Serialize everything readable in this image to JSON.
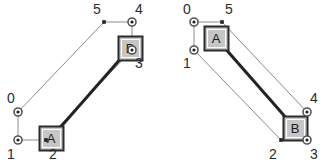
{
  "figure": {
    "background_color": "#ffffff",
    "panels": [
      {
        "id": "left",
        "name": "left-diagram",
        "nodes": [
          {
            "id": "A",
            "label": "A",
            "x": 39,
            "y": 126,
            "w": 24,
            "h": 24,
            "fill": "#c6c6c6",
            "stroke": "#2b2b2b"
          },
          {
            "id": "B",
            "label": "B",
            "x": 118,
            "y": 36,
            "w": 24,
            "h": 24,
            "fill": "#c6c6c6",
            "stroke": "#2b2b2b"
          }
        ],
        "points": [
          {
            "id": "p0",
            "label": "0",
            "x": 18,
            "y": 112,
            "marker": "ring",
            "label_x": 7,
            "label_y": 103
          },
          {
            "id": "p1",
            "label": "1",
            "x": 18,
            "y": 140,
            "marker": "ring",
            "label_x": 7,
            "label_y": 159
          },
          {
            "id": "p2",
            "label": "2",
            "x": 46,
            "y": 140,
            "marker": "dot",
            "label_x": 49,
            "label_y": 159
          },
          {
            "id": "p3",
            "label": "3",
            "x": 132,
            "y": 50,
            "marker": "ring",
            "label_x": 135,
            "label_y": 68
          },
          {
            "id": "p4",
            "label": "4",
            "x": 132,
            "y": 22,
            "marker": "ring",
            "label_x": 135,
            "label_y": 14
          },
          {
            "id": "p5",
            "label": "5",
            "x": 104,
            "y": 22,
            "marker": "dot",
            "label_x": 93,
            "label_y": 14
          }
        ],
        "thin_edges": [
          {
            "from": "p0",
            "to": "p1"
          },
          {
            "from": "p1",
            "to": "p2"
          },
          {
            "from": "p0",
            "to": "p5"
          },
          {
            "from": "p2",
            "to": "p3"
          },
          {
            "from": "p5",
            "to": "p4"
          },
          {
            "from": "p4",
            "to": "p3"
          }
        ],
        "thick_edge": {
          "from": "A",
          "to": "B"
        }
      },
      {
        "id": "right",
        "name": "right-diagram",
        "nodes": [
          {
            "id": "A",
            "label": "A",
            "x": 204,
            "y": 26,
            "w": 24,
            "h": 24,
            "fill": "#c6c6c6",
            "stroke": "#2b2b2b"
          },
          {
            "id": "B",
            "label": "B",
            "x": 283,
            "y": 116,
            "w": 24,
            "h": 24,
            "fill": "#c6c6c6",
            "stroke": "#2b2b2b"
          }
        ],
        "points": [
          {
            "id": "p0",
            "label": "0",
            "x": 194,
            "y": 22,
            "marker": "ring",
            "label_x": 183,
            "label_y": 14
          },
          {
            "id": "p1",
            "label": "1",
            "x": 194,
            "y": 50,
            "marker": "ring",
            "label_x": 183,
            "label_y": 68
          },
          {
            "id": "p5",
            "label": "5",
            "x": 222,
            "y": 22,
            "marker": "dot",
            "label_x": 225,
            "label_y": 14
          },
          {
            "id": "p4",
            "label": "4",
            "x": 307,
            "y": 112,
            "marker": "ring",
            "label_x": 310,
            "label_y": 103
          },
          {
            "id": "p3",
            "label": "3",
            "x": 307,
            "y": 140,
            "marker": "ring",
            "label_x": 310,
            "label_y": 159
          },
          {
            "id": "p2",
            "label": "2",
            "x": 281,
            "y": 140,
            "marker": "dot",
            "label_x": 269,
            "label_y": 159
          }
        ],
        "thin_edges": [
          {
            "from": "p0",
            "to": "p1"
          },
          {
            "from": "p0",
            "to": "p5"
          },
          {
            "from": "p1",
            "to": "p2"
          },
          {
            "from": "p5",
            "to": "p4"
          },
          {
            "from": "p2",
            "to": "p3"
          },
          {
            "from": "p4",
            "to": "p3"
          }
        ],
        "thick_edge": {
          "from": "A",
          "to": "B"
        }
      }
    ],
    "style": {
      "thin_line_color": "#8c8c8c",
      "thin_line_width": 1,
      "thick_line_color": "#222222",
      "thick_line_width": 3,
      "ring_outer_color": "#555555",
      "ring_fill_color": "#ffffff",
      "ring_center_color": "#222222",
      "dot_color": "#222222",
      "point_label_color": "#2b2b2b",
      "node_label_color": "#1a1a1a"
    }
  }
}
